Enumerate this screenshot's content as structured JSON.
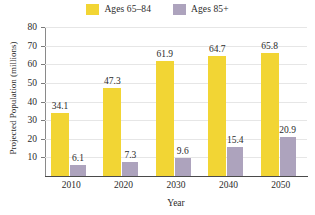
{
  "chart_data": {
    "type": "bar",
    "title": "",
    "subtitle": "",
    "xlabel": "Year",
    "ylabel": "Projected Population (millions)",
    "categories": [
      "2010",
      "2020",
      "2030",
      "2040",
      "2050"
    ],
    "series": [
      {
        "name": "Ages 65–84",
        "color": "#F2D534",
        "values": [
          34.1,
          47.3,
          61.9,
          64.7,
          65.8
        ],
        "labels": [
          "34.1",
          "47.3",
          "61.9",
          "64.7",
          "65.8"
        ]
      },
      {
        "name": "Ages 85+",
        "color": "#ADA3BD",
        "values": [
          6.1,
          7.3,
          9.6,
          15.4,
          20.9
        ],
        "labels": [
          "6.1",
          "7.3",
          "9.6",
          "15.4",
          "20.9"
        ]
      }
    ],
    "ylim": [
      0,
      80
    ],
    "yticks": [
      10,
      20,
      30,
      40,
      50,
      60,
      70,
      80
    ],
    "ytick_labels": [
      "10",
      "20",
      "30",
      "40",
      "50",
      "60",
      "70",
      "80"
    ],
    "grid": true,
    "grid_axis": "y",
    "legend_position": "top-center",
    "background_color": "#FFFFFF",
    "axis_color": "#4A4A4A",
    "gridline_color": "#E6E6E6",
    "data_labels": true
  },
  "legend": {
    "entries": [
      {
        "label": "Ages 65–84",
        "color": "#F2D534"
      },
      {
        "label": "Ages 85+",
        "color": "#ADA3BD"
      }
    ]
  },
  "axes": {
    "y_title": "Projected Population (millions)",
    "x_title": "Year"
  }
}
